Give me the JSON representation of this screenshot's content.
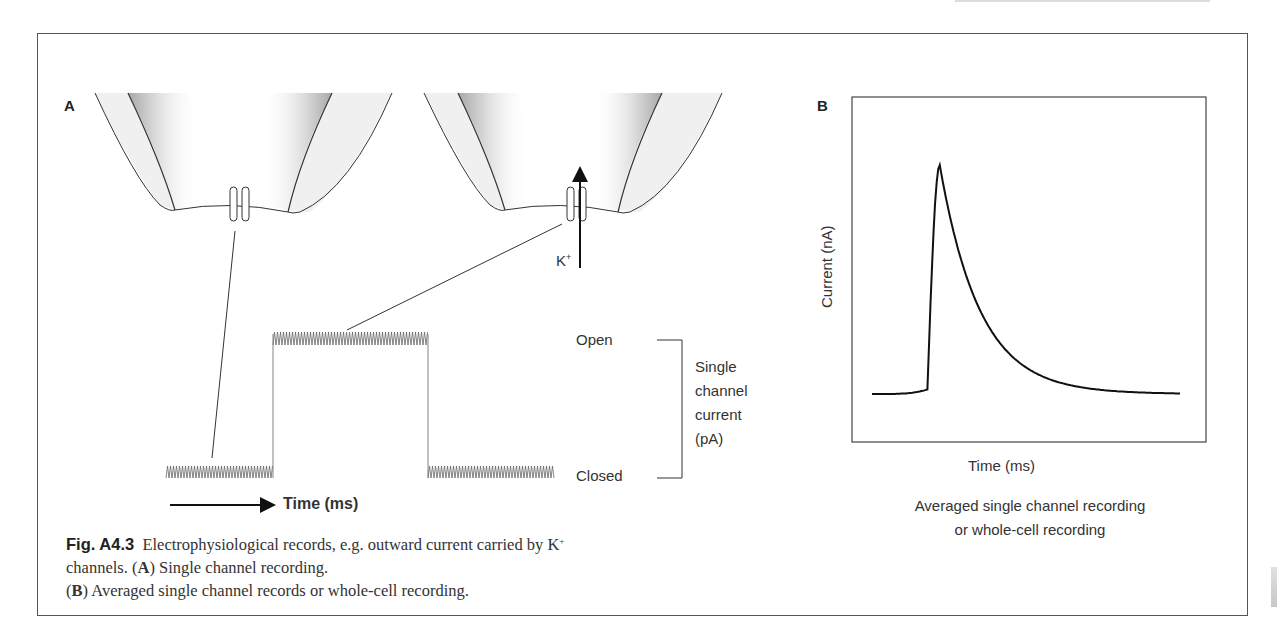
{
  "figure": {
    "number": "Fig. A4.3",
    "caption_parts": {
      "intro": "Electrophysiological records, e.g. outward current carried by K",
      "sup": "+",
      "after_ion": " channels. (",
      "a_letter": "A",
      "a_text": ") Single channel recording.",
      "b_open": "(",
      "b_letter": "B",
      "b_text": ") Averaged single channel records or whole-cell recording."
    }
  },
  "panel_a": {
    "label": "A",
    "ion_label": "K",
    "ion_charge": "+",
    "states": {
      "open": "Open",
      "closed": "Closed"
    },
    "bracket_label": [
      "Single",
      "channel",
      "current",
      "(pA)"
    ],
    "time_axis": "Time (ms)"
  },
  "panel_b": {
    "label": "B",
    "ylabel": "Current (nA)",
    "xlabel": "Time (ms)",
    "subtitle": [
      "Averaged single channel recording",
      "or whole-cell recording"
    ]
  },
  "chart_data": [
    {
      "type": "line",
      "title": "Single channel recording",
      "xlabel": "Time (ms)",
      "ylabel": "Single channel current (pA)",
      "y_levels": [
        "Closed",
        "Open"
      ],
      "x": [
        0,
        1,
        1,
        2.5,
        2.5,
        3.7
      ],
      "values": [
        0,
        0,
        1,
        1,
        0,
        0
      ],
      "notes": "Square pulse with small noise ripple; closed → open → closed"
    },
    {
      "type": "line",
      "title": "Averaged single channel recording or whole-cell recording",
      "xlabel": "Time (ms)",
      "ylabel": "Current (nA)",
      "x": [
        0,
        0.15,
        0.18,
        0.2,
        0.22,
        0.25,
        0.3,
        0.4,
        0.5,
        0.6,
        0.75,
        1.0
      ],
      "values": [
        0,
        0.02,
        0.1,
        0.7,
        1.0,
        0.85,
        0.6,
        0.35,
        0.18,
        0.08,
        0.02,
        0.0
      ],
      "notes": "Fast rise to peak then exponential decay to baseline; no tick values shown"
    }
  ]
}
